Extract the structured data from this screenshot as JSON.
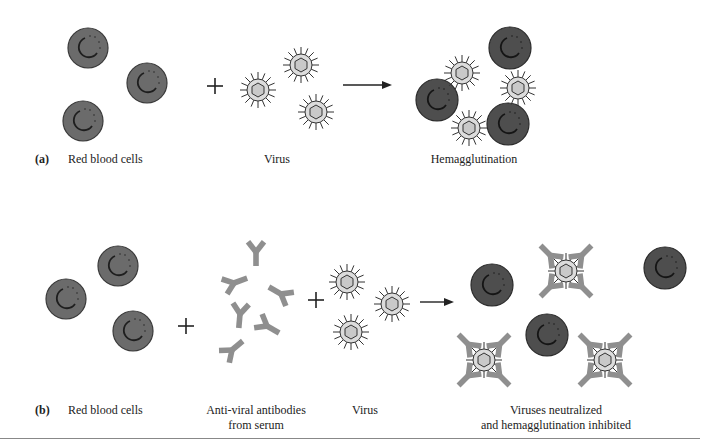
{
  "figure": {
    "panel_a": {
      "letter": "(a)",
      "labels": {
        "rbc": "Red blood cells",
        "virus": "Virus",
        "result": "Hemagglutination"
      },
      "operators": [
        "+",
        "→"
      ],
      "rbcs": [
        [
          88,
          48
        ],
        [
          147,
          83
        ],
        [
          83,
          121
        ]
      ],
      "viruses": [
        [
          301,
          65
        ],
        [
          258,
          90
        ],
        [
          316,
          112
        ]
      ],
      "result_rbcs": [
        [
          510,
          48
        ],
        [
          437,
          100
        ],
        [
          508,
          124
        ]
      ],
      "result_viruses": [
        [
          462,
          73
        ],
        [
          518,
          88
        ],
        [
          469,
          128
        ]
      ]
    },
    "panel_b": {
      "letter": "(b)",
      "labels": {
        "rbc": "Red blood cells",
        "antibodies_line1": "Anti-viral antibodies",
        "antibodies_line2": "from serum",
        "virus": "Virus",
        "result_line1": "Viruses neutralized",
        "result_line2": "and hemagglutination inhibited"
      },
      "operators": [
        "+",
        "+",
        "→"
      ],
      "rbcs": [
        [
          118,
          266
        ],
        [
          66,
          299
        ],
        [
          133,
          331
        ]
      ],
      "antibodies": [
        [
          256,
          248,
          0
        ],
        [
          233,
          282,
          -70
        ],
        [
          283,
          292,
          70
        ],
        [
          240,
          312,
          10
        ],
        [
          268,
          326,
          -60
        ],
        [
          232,
          350,
          -120
        ]
      ],
      "viruses": [
        [
          347,
          282
        ],
        [
          392,
          304
        ],
        [
          351,
          332
        ]
      ],
      "result_rbcs": [
        [
          492,
          285
        ],
        [
          547,
          335
        ],
        [
          665,
          268
        ]
      ],
      "neutralized_viruses": [
        [
          566,
          271
        ],
        [
          484,
          360
        ],
        [
          605,
          360
        ]
      ]
    },
    "colors": {
      "rbc_fill": "#6b6b6b",
      "rbc_dark_fill": "#4e4e4e",
      "rbc_stroke": "#333333",
      "virus_fill": "#d9d9d9",
      "virus_core": "#cfcfcf",
      "antibody": "#8f8f8f",
      "ink": "#222222"
    }
  }
}
